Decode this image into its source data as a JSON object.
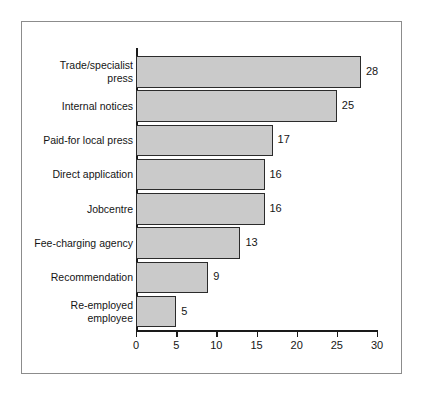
{
  "chart_data": {
    "type": "bar",
    "orientation": "horizontal",
    "title": "",
    "subtitle": "",
    "xlabel": "",
    "ylabel": "",
    "xlim": [
      0,
      30
    ],
    "ylim": null,
    "grid": false,
    "legend": null,
    "xticks": [
      "0",
      "5",
      "10",
      "15",
      "20",
      "25",
      "30"
    ],
    "xtick_values": [
      0,
      5,
      10,
      15,
      20,
      25,
      30
    ],
    "categories": [
      "Trade/specialist\npress",
      "Internal notices",
      "Paid-for local press",
      "Direct application",
      "Jobcentre",
      "Fee-charging agency",
      "Recommendation",
      "Re-employed\nemployee"
    ],
    "values": [
      28,
      25,
      17,
      16,
      16,
      13,
      9,
      5
    ],
    "value_labels": [
      "28",
      "25",
      "17",
      "16",
      "16",
      "13",
      "9",
      "5"
    ],
    "colors": {
      "bar_fill": "#cacaca",
      "bar_edge": "#2b2b2b",
      "axis": "#1a1a1a",
      "text": "#151515",
      "frame": "#8c8c8c",
      "background": "#ffffff"
    }
  }
}
